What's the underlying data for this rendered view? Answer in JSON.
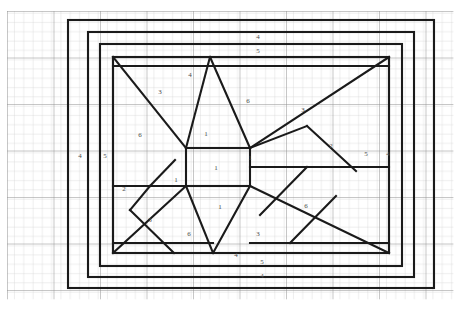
{
  "diagram": {
    "background_color": "#ffffff",
    "line_color": "#1a1a1a",
    "grid": {
      "minor_color": "#c8c8c8",
      "major_color": "#8f8f8f",
      "minor_spacing_px": 9.3,
      "major_every": 5,
      "origin_x": 7,
      "origin_y": 11,
      "cols": 48,
      "rows": 32
    },
    "frame": {
      "outer": {
        "x": 68,
        "y": 20,
        "w": 366,
        "h": 268
      },
      "mid": {
        "x": 88,
        "y": 32,
        "w": 326,
        "h": 245
      },
      "inner": {
        "x": 100,
        "y": 44,
        "w": 302,
        "h": 222
      },
      "panel": {
        "x": 113,
        "y": 57,
        "w": 276,
        "h": 196
      }
    },
    "center_square": {
      "x": 186,
      "y": 148,
      "w": 64,
      "h": 38
    }
  },
  "labels": [
    {
      "id": "top-outer",
      "text": "4",
      "x": 258,
      "y": 37
    },
    {
      "id": "top-inner",
      "text": "5",
      "x": 258,
      "y": 51
    },
    {
      "id": "top-left-panel",
      "text": "4",
      "x": 190,
      "y": 75
    },
    {
      "id": "upper-left-3",
      "text": "3",
      "x": 160,
      "y": 92
    },
    {
      "id": "upper-left-6",
      "text": "6",
      "x": 140,
      "y": 135
    },
    {
      "id": "upper-mid-6",
      "text": "6",
      "x": 248,
      "y": 101
    },
    {
      "id": "upper-right-3",
      "text": "3",
      "x": 303,
      "y": 110
    },
    {
      "id": "right-2",
      "text": "2",
      "x": 331,
      "y": 146
    },
    {
      "id": "left-outer-4",
      "text": "4",
      "x": 80,
      "y": 156
    },
    {
      "id": "left-inner-5",
      "text": "5",
      "x": 105,
      "y": 156
    },
    {
      "id": "right-inner-5",
      "text": "5",
      "x": 366,
      "y": 154
    },
    {
      "id": "right-outer-4",
      "text": "4",
      "x": 388,
      "y": 154
    },
    {
      "id": "center-top-1",
      "text": "1",
      "x": 206,
      "y": 134
    },
    {
      "id": "center-mid-1",
      "text": "1",
      "x": 216,
      "y": 168
    },
    {
      "id": "center-right-1",
      "text": "1",
      "x": 250,
      "y": 158
    },
    {
      "id": "center-left-1",
      "text": "1",
      "x": 176,
      "y": 180
    },
    {
      "id": "center-low-1",
      "text": "1",
      "x": 220,
      "y": 207
    },
    {
      "id": "lower-left-2",
      "text": "2",
      "x": 124,
      "y": 189
    },
    {
      "id": "lower-left-3",
      "text": "3",
      "x": 150,
      "y": 220
    },
    {
      "id": "lower-left-6",
      "text": "6",
      "x": 189,
      "y": 234
    },
    {
      "id": "lower-right-6",
      "text": "6",
      "x": 306,
      "y": 206
    },
    {
      "id": "lower-mid-3",
      "text": "3",
      "x": 258,
      "y": 234
    },
    {
      "id": "bottom-panel-4",
      "text": "4",
      "x": 236,
      "y": 255
    },
    {
      "id": "bottom-inner-5",
      "text": "5",
      "x": 262,
      "y": 262
    },
    {
      "id": "bottom-outer-4",
      "text": "4",
      "x": 262,
      "y": 276
    }
  ],
  "construction_lines": {
    "description": "Diagonal bracing forming an X/star pattern radiating from a central rectangle to the panel corners and edges",
    "segments": [
      "panel-top-left-corner to center-top-left",
      "panel-top-right-corner to center-top-right",
      "panel-bottom-left-corner to center-bottom-left",
      "panel-bottom-right-corner to center-bottom-right",
      "center-top-left to panel-top-mid",
      "center-top-right to panel-top-mid",
      "center-bottom-left to panel-bottom-mid",
      "center-bottom-right to panel-bottom-mid",
      "left-vertical-strut",
      "right-vertical-strut"
    ]
  }
}
